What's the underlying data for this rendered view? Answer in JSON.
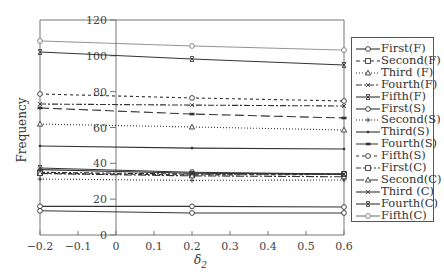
{
  "chart_data": {
    "type": "line",
    "title": "",
    "xlabel": "δ2",
    "ylabel": "Frequency",
    "xlim": [
      -0.2,
      0.6
    ],
    "ylim": [
      0,
      120
    ],
    "x_ticks": [
      "-0.2",
      "-0.1",
      "0",
      "0.1",
      "0.2",
      "0.3",
      "0.4",
      "0.5",
      "0.6"
    ],
    "y_ticks": [
      "0",
      "20",
      "40",
      "60",
      "80",
      "100",
      "120"
    ],
    "grid": false,
    "legend_position": "right",
    "x": [
      -0.2,
      0.2,
      0.6
    ],
    "series": [
      {
        "name": "First(F)",
        "values": [
          13.5,
          12.3,
          12.3
        ],
        "marker": "o",
        "dash": "solid"
      },
      {
        "name": "Second(F)",
        "values": [
          34.5,
          33.5,
          33.8
        ],
        "marker": "s",
        "dash": "4,3"
      },
      {
        "name": "Third (F)",
        "values": [
          61.9,
          60.3,
          58.6
        ],
        "marker": "^",
        "dash": "1,2"
      },
      {
        "name": "Fourth(F)",
        "values": [
          73.1,
          72.5,
          72.0
        ],
        "marker": "x",
        "dash": "6,2,2,2"
      },
      {
        "name": "Fifth(F)",
        "values": [
          102.1,
          98.2,
          94.9
        ],
        "marker": "xbar",
        "dash": "solid"
      },
      {
        "name": "First(S)",
        "values": [
          16.0,
          16.0,
          15.6
        ],
        "marker": "o",
        "dash": "solid"
      },
      {
        "name": "Second(S)",
        "values": [
          31.2,
          30.5,
          30.7
        ],
        "marker": "+",
        "dash": "1,2"
      },
      {
        "name": "Third(S)",
        "values": [
          49.7,
          48.5,
          48.0
        ],
        "marker": "dot",
        "dash": "solid"
      },
      {
        "name": "Fourth(S)",
        "values": [
          70.9,
          67.5,
          65.3
        ],
        "marker": "dash",
        "dash": "9,4"
      },
      {
        "name": "Fifth(S)",
        "values": [
          78.7,
          76.5,
          74.8
        ],
        "marker": "o",
        "dash": "3,3"
      },
      {
        "name": "First(C)",
        "values": [
          35.0,
          34.0,
          34.0
        ],
        "marker": "s",
        "dash": "5,2,2,2"
      },
      {
        "name": "Second(C)",
        "values": [
          34.3,
          33.0,
          32.5
        ],
        "marker": "^",
        "dash": "8,2,2,2"
      },
      {
        "name": "Third (C)",
        "values": [
          36.5,
          34.5,
          34.0
        ],
        "marker": "x",
        "dash": "solid"
      },
      {
        "name": "Fourth(C)",
        "values": [
          37.4,
          35.0,
          34.0
        ],
        "marker": "xbar",
        "dash": "solid"
      },
      {
        "name": "Fifth(C)",
        "values": [
          108.3,
          105.5,
          103.2
        ],
        "marker": "o",
        "dash": "solid",
        "thin": true
      }
    ]
  },
  "axes": {
    "xlabel_main": "δ",
    "xlabel_sub": "2",
    "ylabel": "Frequency"
  }
}
